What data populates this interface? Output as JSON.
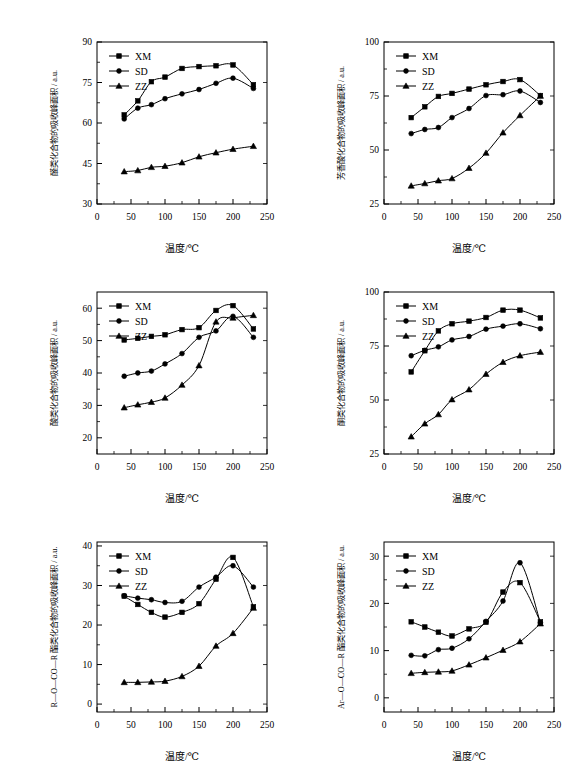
{
  "figure": {
    "background": "#ffffff",
    "line_color": "#000000",
    "panel_count": 6,
    "common": {
      "xlabel": "温度/℃",
      "xlim": [
        0,
        250
      ],
      "xticks": [
        0,
        50,
        100,
        150,
        200,
        250
      ],
      "legend_entries": [
        {
          "label": "XM",
          "marker": "square"
        },
        {
          "label": "SD",
          "marker": "circle"
        },
        {
          "label": "ZZ",
          "marker": "triangle"
        }
      ],
      "legend_position": "top-left",
      "grid": false
    }
  },
  "chart_data": [
    {
      "id": "panel-a",
      "type": "line",
      "title": "",
      "xlabel": "温度/℃",
      "ylabel": "醛类化合物的吸收峰面积 / a.u.",
      "xlim": [
        0,
        250
      ],
      "ylim": [
        30,
        90
      ],
      "xticks": [
        0,
        50,
        100,
        150,
        200,
        250
      ],
      "yticks": [
        30,
        45,
        60,
        75,
        90
      ],
      "grid": false,
      "legend_position": "top-left",
      "x": [
        40,
        60,
        80,
        100,
        125,
        150,
        175,
        200,
        230
      ],
      "series": [
        {
          "name": "XM",
          "marker": "square",
          "values": [
            63.0,
            68.2,
            75.3,
            77.0,
            80.2,
            80.9,
            81.2,
            81.5,
            74.2
          ]
        },
        {
          "name": "SD",
          "marker": "circle",
          "values": [
            61.5,
            65.5,
            66.8,
            69.0,
            70.8,
            72.4,
            74.7,
            76.6,
            72.8
          ]
        },
        {
          "name": "ZZ",
          "marker": "triangle",
          "values": [
            42.0,
            42.4,
            43.6,
            44.0,
            45.3,
            47.5,
            49.0,
            50.3,
            51.4
          ]
        }
      ]
    },
    {
      "id": "panel-b",
      "type": "line",
      "title": "",
      "xlabel": "温度/℃",
      "ylabel": "芳香酸化合物的吸收峰面积 / a.u.",
      "xlim": [
        0,
        250
      ],
      "ylim": [
        25,
        100
      ],
      "xticks": [
        0,
        50,
        100,
        150,
        200,
        250
      ],
      "yticks": [
        25,
        50,
        75,
        100
      ],
      "grid": false,
      "legend_position": "top-left",
      "x": [
        40,
        60,
        80,
        100,
        125,
        150,
        175,
        200,
        230
      ],
      "series": [
        {
          "name": "XM",
          "marker": "square",
          "values": [
            65.0,
            70.0,
            74.8,
            76.2,
            78.2,
            80.2,
            81.7,
            82.6,
            75.2
          ]
        },
        {
          "name": "SD",
          "marker": "circle",
          "values": [
            57.6,
            59.5,
            60.4,
            65.0,
            69.2,
            75.2,
            75.6,
            77.3,
            72.0
          ]
        },
        {
          "name": "ZZ",
          "marker": "triangle",
          "values": [
            33.4,
            34.5,
            35.8,
            36.8,
            41.6,
            48.6,
            58.0,
            66.0,
            75.0
          ]
        }
      ]
    },
    {
      "id": "panel-c",
      "type": "line",
      "title": "",
      "xlabel": "温度/℃",
      "ylabel": "酸类化合物的吸收峰面积 / a.u.",
      "xlim": [
        0,
        250
      ],
      "ylim": [
        15,
        65
      ],
      "xticks": [
        0,
        50,
        100,
        150,
        200,
        250
      ],
      "yticks": [
        20,
        30,
        40,
        50,
        60
      ],
      "grid": false,
      "legend_position": "top-left",
      "x": [
        40,
        60,
        80,
        100,
        125,
        150,
        175,
        200,
        230
      ],
      "series": [
        {
          "name": "XM",
          "marker": "square",
          "values": [
            50.2,
            50.7,
            51.3,
            51.8,
            53.4,
            54.0,
            59.3,
            60.8,
            53.6
          ]
        },
        {
          "name": "SD",
          "marker": "circle",
          "values": [
            39.0,
            40.0,
            40.6,
            42.8,
            46.0,
            51.0,
            53.0,
            57.5,
            51.0
          ]
        },
        {
          "name": "ZZ",
          "marker": "triangle",
          "values": [
            29.3,
            30.2,
            31.0,
            32.3,
            36.3,
            42.3,
            55.8,
            57.0,
            57.8
          ]
        }
      ]
    },
    {
      "id": "panel-d",
      "type": "line",
      "title": "",
      "xlabel": "温度/℃",
      "ylabel": "酮类化合物的吸收峰面积 / a.u.",
      "xlim": [
        0,
        250
      ],
      "ylim": [
        25,
        100
      ],
      "xticks": [
        0,
        50,
        100,
        150,
        200,
        250
      ],
      "yticks": [
        25,
        50,
        75,
        100
      ],
      "grid": false,
      "legend_position": "top-left",
      "x": [
        40,
        60,
        80,
        100,
        125,
        150,
        175,
        200,
        230
      ],
      "series": [
        {
          "name": "XM",
          "marker": "square",
          "values": [
            63.0,
            72.8,
            82.0,
            85.3,
            86.5,
            88.2,
            91.6,
            91.6,
            88.0
          ]
        },
        {
          "name": "SD",
          "marker": "circle",
          "values": [
            70.5,
            73.0,
            74.6,
            77.8,
            79.4,
            82.8,
            84.2,
            85.3,
            83.0
          ]
        },
        {
          "name": "ZZ",
          "marker": "triangle",
          "values": [
            33.0,
            39.0,
            43.3,
            50.2,
            54.8,
            62.0,
            67.5,
            70.5,
            72.2
          ]
        }
      ]
    },
    {
      "id": "panel-e",
      "type": "line",
      "title": "",
      "xlabel": "温度/℃",
      "ylabel": "R—O—CO—R 酯类化合物的吸收峰面积 / a.u.",
      "xlim": [
        0,
        250
      ],
      "ylim": [
        -2,
        41
      ],
      "xticks": [
        0,
        50,
        100,
        150,
        200,
        250
      ],
      "yticks": [
        0,
        10,
        20,
        30,
        40
      ],
      "grid": false,
      "legend_position": "top-left",
      "x": [
        40,
        60,
        80,
        100,
        125,
        150,
        175,
        200,
        230
      ],
      "series": [
        {
          "name": "XM",
          "marker": "square",
          "values": [
            27.3,
            25.2,
            23.2,
            22.0,
            23.2,
            25.4,
            31.6,
            37.1,
            24.6
          ]
        },
        {
          "name": "SD",
          "marker": "circle",
          "values": [
            27.4,
            26.8,
            26.4,
            25.7,
            26.0,
            29.6,
            32.1,
            35.0,
            29.6
          ]
        },
        {
          "name": "ZZ",
          "marker": "triangle",
          "values": [
            5.5,
            5.5,
            5.6,
            5.8,
            7.0,
            9.6,
            14.7,
            17.9,
            24.3
          ]
        }
      ]
    },
    {
      "id": "panel-f",
      "type": "line",
      "title": "",
      "xlabel": "温度/℃",
      "ylabel": "Ar—O—CO—R 酯类化合物的吸收峰面积 / a.u.",
      "xlim": [
        0,
        250
      ],
      "ylim": [
        -3,
        33
      ],
      "xticks": [
        0,
        50,
        100,
        150,
        200,
        250
      ],
      "yticks": [
        0,
        10,
        20,
        30
      ],
      "grid": false,
      "legend_position": "top-left",
      "x": [
        40,
        60,
        80,
        100,
        125,
        150,
        175,
        200,
        230
      ],
      "series": [
        {
          "name": "XM",
          "marker": "square",
          "values": [
            16.1,
            15.0,
            13.9,
            13.1,
            14.6,
            16.0,
            22.4,
            24.4,
            16.1
          ]
        },
        {
          "name": "SD",
          "marker": "circle",
          "values": [
            9.0,
            8.9,
            10.2,
            10.5,
            12.5,
            16.2,
            20.5,
            28.6,
            15.9
          ]
        },
        {
          "name": "ZZ",
          "marker": "triangle",
          "values": [
            5.2,
            5.4,
            5.5,
            5.7,
            7.0,
            8.5,
            10.1,
            11.9,
            15.7
          ]
        }
      ]
    }
  ]
}
